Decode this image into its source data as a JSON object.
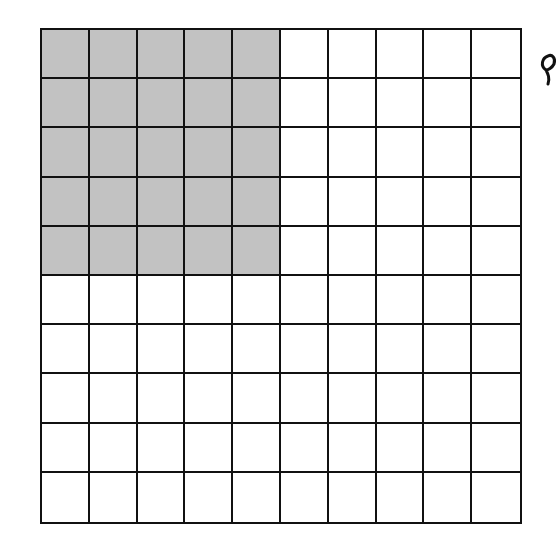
{
  "figure": {
    "type": "hundred-grid",
    "rows": 10,
    "cols": 10,
    "shaded_rows": 5,
    "shaded_cols": 5,
    "shaded_count": 25,
    "total_count": 100,
    "colors": {
      "shade": "#c2c2c2",
      "line": "#111111",
      "background": "#ffffff"
    }
  }
}
